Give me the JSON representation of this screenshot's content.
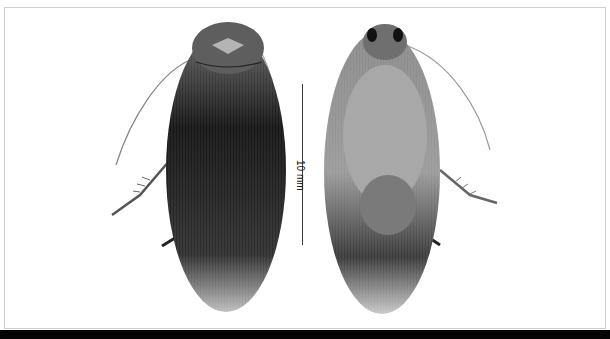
{
  "figure": {
    "views": [
      {
        "name": "dorsal view"
      },
      {
        "name": "ventral view"
      }
    ],
    "scale_bar": {
      "label": "10 mm"
    }
  }
}
